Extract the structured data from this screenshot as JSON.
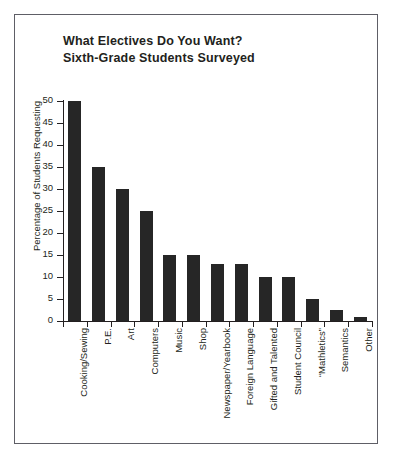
{
  "chart_data": {
    "type": "bar",
    "title": "What Electives Do You Want?",
    "subtitle": "Sixth-Grade Students Surveyed",
    "title_lines": [
      "What Electives Do You Want?",
      "Sixth-Grade Students Surveyed"
    ],
    "xlabel": "",
    "ylabel": "Percentage of Students Requesting",
    "ylim": [
      0,
      50
    ],
    "ytick_values": [
      0,
      5,
      10,
      15,
      20,
      25,
      30,
      35,
      40,
      45,
      50
    ],
    "ytick_labels": [
      "0",
      "5",
      "10",
      "15",
      "20",
      "25",
      "30",
      "35",
      "40",
      "45",
      "50"
    ],
    "grid": false,
    "legend": false,
    "bar_color": "#262626",
    "axis_color": "#231f20",
    "categories": [
      "Cooking/Sewing",
      "P.E.",
      "Art",
      "Computers",
      "Music",
      "Shop",
      "Newspaper/Yearbook",
      "Foreign Language",
      "Gifted and Talented",
      "Student Council",
      "“Mathletics”",
      "Semantics",
      "Other"
    ],
    "values": [
      50,
      35,
      30,
      25,
      15,
      15,
      13,
      13,
      10,
      10,
      5,
      2.5,
      1
    ]
  }
}
